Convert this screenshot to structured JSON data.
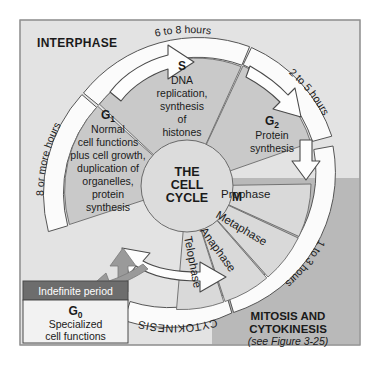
{
  "figure": {
    "center_title_lines": [
      "THE",
      "CELL",
      "CYCLE"
    ],
    "interphase_label": "INTERPHASE",
    "mitosis_label_lines": [
      "MITOSIS AND",
      "CYTOKINESIS"
    ],
    "mitosis_reference": "(see Figure 3-25)",
    "cytokinesis_label": "CYTOKINESIS",
    "m_label": "M"
  },
  "phases": [
    {
      "key": "g1",
      "name": "G",
      "subscript": "1",
      "duration": "8 or more hours",
      "description_lines": [
        "Normal",
        "cell functions",
        "plus cell growth,",
        "duplication of",
        "organelles,",
        "protein",
        "synthesis"
      ]
    },
    {
      "key": "s",
      "name": "S",
      "subscript": "",
      "duration": "6 to 8 hours",
      "description_lines": [
        "DNA",
        "replication,",
        "synthesis",
        "of",
        "histones"
      ]
    },
    {
      "key": "g2",
      "name": "G",
      "subscript": "2",
      "duration": "2 to 5 hours",
      "description_lines": [
        "Protein",
        "synthesis"
      ]
    },
    {
      "key": "m",
      "name": "M",
      "subscript": "",
      "duration": "1 to 3 hours",
      "description_lines": []
    }
  ],
  "mitosis_stages": [
    {
      "label": "Prophase"
    },
    {
      "label": "Metaphase"
    },
    {
      "label": "Anaphase"
    },
    {
      "label": "Telophase"
    }
  ],
  "g0_box": {
    "header": "Indefinite period",
    "name": "G",
    "subscript": "0",
    "description_lines": [
      "Specialized",
      "cell functions"
    ]
  },
  "colors": {
    "page_background": "#ffffff",
    "interphase_background": "#e3e3e3",
    "mitosis_background": "#b9b9b9",
    "interphase_wedge": "#c9c9c9",
    "mitosis_wedge": "#d9d9d9",
    "center_circle": "#dcdcdc",
    "timing_band": "#fbfbfb",
    "g0_header": "#6d6d6d",
    "g0_body": "#f2f2f2",
    "arrow_white": "#fdfdfd",
    "arrow_gray": "#9a9a9a",
    "outline": "#4a4a4a",
    "text": "#1a1a1a",
    "g0_header_text": "#ffffff"
  }
}
